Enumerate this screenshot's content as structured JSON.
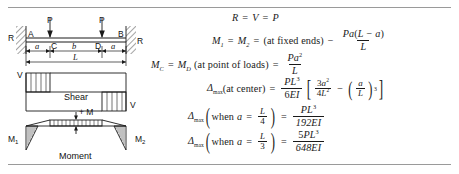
{
  "figure": {
    "load_left_label": "P",
    "load_right_label": "P",
    "reaction_left_label": "R",
    "reaction_right_label": "R",
    "point_a_label": "A",
    "point_b_label": "B",
    "point_c_label": "C",
    "point_d_label": "D",
    "dim_a_left_label": "a",
    "dim_b_label": "b",
    "dim_a_right_label": "a",
    "dim_L_label": "L",
    "shear_left_label": "V",
    "shear_right_label": "V",
    "shear_caption": "Shear",
    "moment_left_label": "M",
    "moment_left_sub": "1",
    "moment_right_label": "M",
    "moment_right_sub": "2",
    "moment_pos_label": "+ M",
    "moment_caption": "Moment"
  },
  "equations": {
    "reaction": {
      "R": "R",
      "eq1": "=",
      "V": "V",
      "eq2": "=",
      "P": "P"
    },
    "end_moment": {
      "M1": "M",
      "M1_sub": "1",
      "eq1": "=",
      "M2": "M",
      "M2_sub": "2",
      "eq2": "=",
      "note": "(at fixed ends)",
      "minus": "−",
      "num_P": "P",
      "num_a": "a",
      "num_paren_open": "(",
      "num_L": "L",
      "num_minus": "−",
      "num_a2": "a",
      "num_paren_close": ")",
      "den": "L"
    },
    "load_moment": {
      "MC": "M",
      "MC_sub": "C",
      "eq1": "=",
      "MD": "M",
      "MD_sub": "D",
      "note": "(at point of loads)",
      "eq2": "=",
      "num_P": "P",
      "num_a": "a",
      "num_exp": "2",
      "den": "L"
    },
    "deflection_center": {
      "delta": "Δ",
      "delta_sub": "max",
      "note": "(at center)",
      "eq1": "=",
      "num_P": "P",
      "num_L": "L",
      "num_exp": "3",
      "den_6": "6",
      "den_EI": "EI",
      "b_num_3": "3",
      "b_num_a": "a",
      "b_num_exp": "2",
      "b_den_4": "4",
      "b_den_L": "L",
      "b_den_exp": "2",
      "b_minus": "−",
      "b_frac_a": "a",
      "b_frac_L": "L",
      "b_power": "3"
    },
    "deflection_quarter": {
      "delta": "Δ",
      "delta_sub": "max",
      "when": "when",
      "a": "a",
      "eq_in": "=",
      "frac_num": "L",
      "frac_den": "4",
      "eq1": "=",
      "num_P": "P",
      "num_L": "L",
      "num_exp": "3",
      "den": "192EI"
    },
    "deflection_third": {
      "delta": "Δ",
      "delta_sub": "max",
      "when": "when",
      "a": "a",
      "eq_in": "=",
      "frac_num": "L",
      "frac_den": "3",
      "eq1": "=",
      "num_5": "5",
      "num_P": "P",
      "num_L": "L",
      "num_exp": "3",
      "den": "648EI"
    }
  },
  "colors": {
    "ink": "#1a1a1a",
    "rule": "#9a9a9a",
    "background": "#ffffff"
  }
}
